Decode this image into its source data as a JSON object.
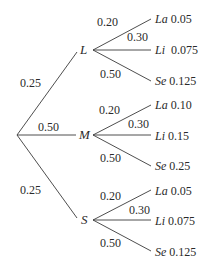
{
  "root": {
    "branches": [
      {
        "node": "L",
        "prob": "0.25",
        "children": [
          {
            "prob": "0.20",
            "name": "La",
            "joint": "0.05"
          },
          {
            "prob": "0.30",
            "name": "Li",
            "joint": "0.075"
          },
          {
            "prob": "0.50",
            "name": "Se",
            "joint": "0.125"
          }
        ]
      },
      {
        "node": "M",
        "prob": "0.50",
        "children": [
          {
            "prob": "0.20",
            "name": "La",
            "joint": "0.10"
          },
          {
            "prob": "0.30",
            "name": "Li",
            "joint": "0.15"
          },
          {
            "prob": "0.50",
            "name": "Se",
            "joint": "0.25"
          }
        ]
      },
      {
        "node": "S",
        "prob": "0.25",
        "children": [
          {
            "prob": "0.20",
            "name": "La",
            "joint": "0.05"
          },
          {
            "prob": "0.30",
            "name": "Li",
            "joint": "0.075"
          },
          {
            "prob": "0.50",
            "name": "Se",
            "joint": "0.125"
          }
        ]
      }
    ]
  },
  "colors": {
    "line": "#3a3a3a",
    "text": "#2a2a2a",
    "background": "#ffffff"
  }
}
